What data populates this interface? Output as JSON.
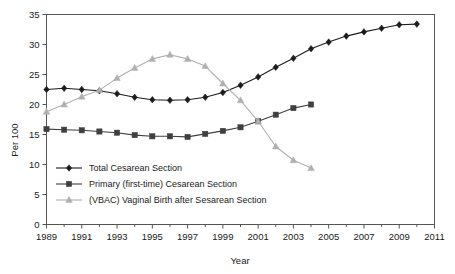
{
  "chart_data": {
    "type": "line",
    "title": "",
    "xlabel": "Year",
    "ylabel": "Per 100",
    "xlim": [
      1989,
      2011
    ],
    "ylim": [
      0,
      35
    ],
    "grid": false,
    "legend_position": "inside-lower-left",
    "x": [
      1989,
      1990,
      1991,
      1992,
      1993,
      1994,
      1995,
      1996,
      1997,
      1998,
      1999,
      2000,
      2001,
      2002,
      2003,
      2004,
      2005,
      2006,
      2007,
      2008,
      2009,
      2010
    ],
    "xtick_labels": [
      "1989",
      "1991",
      "1993",
      "1995",
      "1997",
      "1999",
      "2001",
      "2003",
      "2005",
      "2007",
      "2009",
      "2011"
    ],
    "xtick_values": [
      1989,
      1991,
      1993,
      1995,
      1997,
      1999,
      2001,
      2003,
      2005,
      2007,
      2009,
      2011
    ],
    "ytick_labels": [
      "0",
      "5",
      "10",
      "15",
      "20",
      "25",
      "30",
      "35"
    ],
    "ytick_values": [
      0,
      5,
      10,
      15,
      20,
      25,
      30,
      35
    ],
    "series": [
      {
        "name": "Total Cesarean Section",
        "marker": "diamond",
        "color": "#1c1c1c",
        "x": [
          1989,
          1990,
          1991,
          1992,
          1993,
          1994,
          1995,
          1996,
          1997,
          1998,
          1999,
          2000,
          2001,
          2002,
          2003,
          2004,
          2005,
          2006,
          2007,
          2008,
          2009,
          2010
        ],
        "values": [
          22.5,
          22.7,
          22.5,
          22.3,
          21.8,
          21.2,
          20.8,
          20.7,
          20.8,
          21.2,
          22.0,
          23.2,
          24.6,
          26.2,
          27.7,
          29.3,
          30.4,
          31.4,
          32.1,
          32.7,
          33.3,
          33.4
        ]
      },
      {
        "name": "Primary (first-time) Cesarean Section",
        "marker": "square",
        "color": "#3f3f3f",
        "x": [
          1989,
          1990,
          1991,
          1992,
          1993,
          1994,
          1995,
          1996,
          1997,
          1998,
          1999,
          2000,
          2001,
          2002,
          2003,
          2004
        ],
        "values": [
          15.9,
          15.8,
          15.7,
          15.5,
          15.3,
          14.9,
          14.7,
          14.7,
          14.6,
          15.1,
          15.6,
          16.2,
          17.2,
          18.3,
          19.4,
          20.0
        ]
      },
      {
        "name": "(VBAC) Vaginal Birth after Sesarean Section",
        "marker": "triangle",
        "color": "#b0b0b0",
        "x": [
          1989,
          1990,
          1991,
          1992,
          1993,
          1994,
          1995,
          1996,
          1997,
          1998,
          1999,
          2000,
          2001,
          2002,
          2003,
          2004
        ],
        "values": [
          18.8,
          20.0,
          21.3,
          22.4,
          24.4,
          26.1,
          27.6,
          28.3,
          27.6,
          26.4,
          23.5,
          20.7,
          17.2,
          13.0,
          10.7,
          9.4
        ]
      }
    ]
  },
  "legend": {
    "items": [
      {
        "label": "Total Cesarean Section"
      },
      {
        "label": "Primary (first-time) Cesarean Section"
      },
      {
        "label": "(VBAC) Vaginal Birth after Sesarean Section"
      }
    ]
  },
  "axes": {
    "y_title": "Per 100",
    "x_title": "Year"
  }
}
